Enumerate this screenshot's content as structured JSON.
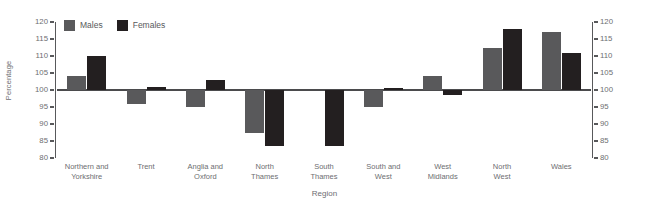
{
  "chart_data": {
    "type": "bar",
    "title": "",
    "xlabel": "Region",
    "ylabel": "Percentage",
    "ylim": [
      80,
      120
    ],
    "yticks": [
      80,
      85,
      90,
      95,
      100,
      105,
      110,
      115,
      120
    ],
    "baseline": 100,
    "grid": false,
    "legend_position": "top-left",
    "dual_y_axis": true,
    "categories": [
      "Northern and\nYorkshire",
      "Trent",
      "Anglia and\nOxford",
      "North\nThames",
      "South\nThames",
      "South and\nWest",
      "West\nMidlands",
      "North\nWest",
      "Wales"
    ],
    "series": [
      {
        "name": "Males",
        "color": "#59595b",
        "values": [
          104,
          96,
          95,
          87.5,
          100,
          95,
          104,
          112.5,
          117
        ]
      },
      {
        "name": "Females",
        "color": "#231f20",
        "values": [
          110,
          101,
          103,
          83.5,
          83.5,
          100.5,
          98.5,
          118,
          111
        ]
      }
    ]
  },
  "axis": {
    "y_title": "Percentage",
    "x_title": "Region",
    "tick_labels": [
      "120",
      "115",
      "110",
      "105",
      "100",
      "95",
      "90",
      "85",
      "80"
    ]
  },
  "legend": {
    "items": [
      {
        "label": "Males",
        "color": "#59595b"
      },
      {
        "label": "Females",
        "color": "#231f20"
      }
    ]
  }
}
